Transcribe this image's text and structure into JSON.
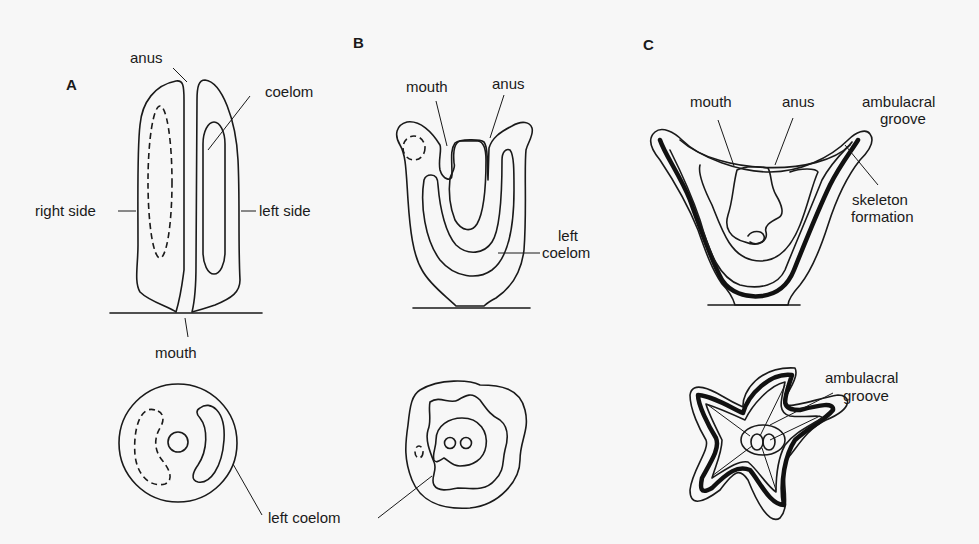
{
  "panels": {
    "A": {
      "letter": "A",
      "labels": {
        "anus": "anus",
        "coelom": "coelom",
        "right_side": "right side",
        "left_side": "left side",
        "mouth": "mouth"
      }
    },
    "B": {
      "letter": "B",
      "labels": {
        "mouth": "mouth",
        "anus": "anus",
        "left_coelom_line1": "left",
        "left_coelom_line2": "coelom"
      }
    },
    "C": {
      "letter": "C",
      "labels": {
        "mouth": "mouth",
        "anus": "anus",
        "ambulacral_groove_line1": "ambulacral",
        "ambulacral_groove_line2": "groove",
        "skeleton_formation_line1": "skeleton",
        "skeleton_formation_line2": "formation",
        "bottom_ambulacral_line1": "ambulacral",
        "bottom_ambulacral_line2": "groove"
      }
    },
    "shared": {
      "left_coelom": "left coelom"
    }
  },
  "colors": {
    "background": "#f7f7f7",
    "ink": "#1a1a1a"
  }
}
